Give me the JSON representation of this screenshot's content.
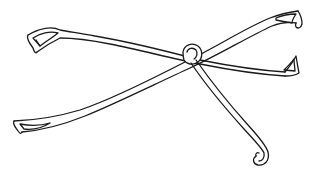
{
  "illustration": {
    "subject": "forceps line drawing",
    "stroke_color": "#1a1a1a",
    "background_color": "#ffffff",
    "parts": [
      "upper-left blade tip",
      "lower-left blade tip",
      "upper-right blade tip",
      "middle-right blade tip",
      "pivot loop",
      "hooked stem"
    ]
  }
}
